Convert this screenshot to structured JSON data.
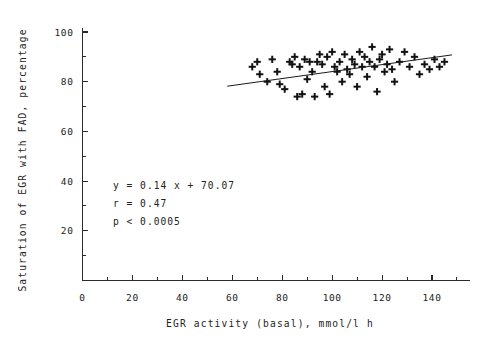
{
  "chart_data": {
    "type": "scatter",
    "title": "",
    "xlabel": "EGR activity (basal), mmol/l h",
    "ylabel": "Saturation of EGR with FAD, percentage",
    "xlim": [
      0,
      160
    ],
    "ylim": [
      0,
      110
    ],
    "x_ticks": [
      0,
      20,
      40,
      60,
      80,
      100,
      120,
      140
    ],
    "x_tick_labels": [
      "0",
      "20",
      "40",
      "60",
      "80",
      "100",
      "120",
      "140"
    ],
    "x_minor_step": 10,
    "y_ticks": [
      20,
      40,
      60,
      80,
      100
    ],
    "y_tick_labels": [
      "20",
      "40",
      "60",
      "80",
      "100"
    ],
    "y_minor_step": 10,
    "grid": false,
    "legend": false,
    "marker": "plus",
    "marker_color": "#121212",
    "line_color": "#1a1a1a",
    "annotations": {
      "equation": "y = 0.14 x + 70.07",
      "correlation": "r = 0.47",
      "pvalue": "p < 0.0005"
    },
    "fit": {
      "slope": 0.14,
      "intercept": 70.07,
      "r": 0.47,
      "p_text": "p < 0.0005",
      "x_start": 58,
      "x_end": 148
    },
    "points": [
      [
        68,
        86
      ],
      [
        70,
        88
      ],
      [
        71,
        83
      ],
      [
        74,
        80
      ],
      [
        76,
        89
      ],
      [
        78,
        84
      ],
      [
        79,
        79
      ],
      [
        81,
        77
      ],
      [
        83,
        88
      ],
      [
        84,
        87
      ],
      [
        85,
        90
      ],
      [
        86,
        74
      ],
      [
        87,
        86
      ],
      [
        88,
        75
      ],
      [
        89,
        89
      ],
      [
        90,
        81
      ],
      [
        91,
        88
      ],
      [
        92,
        84
      ],
      [
        93,
        74
      ],
      [
        94,
        88
      ],
      [
        95,
        91
      ],
      [
        96,
        87
      ],
      [
        97,
        78
      ],
      [
        98,
        90
      ],
      [
        99,
        75
      ],
      [
        100,
        92
      ],
      [
        101,
        86
      ],
      [
        102,
        84
      ],
      [
        103,
        88
      ],
      [
        104,
        80
      ],
      [
        105,
        91
      ],
      [
        106,
        85
      ],
      [
        107,
        83
      ],
      [
        108,
        89
      ],
      [
        109,
        87
      ],
      [
        110,
        78
      ],
      [
        111,
        92
      ],
      [
        112,
        86
      ],
      [
        113,
        90
      ],
      [
        114,
        82
      ],
      [
        115,
        88
      ],
      [
        116,
        94
      ],
      [
        117,
        86
      ],
      [
        118,
        76
      ],
      [
        119,
        89
      ],
      [
        120,
        91
      ],
      [
        121,
        84
      ],
      [
        122,
        87
      ],
      [
        123,
        93
      ],
      [
        124,
        85
      ],
      [
        125,
        80
      ],
      [
        127,
        88
      ],
      [
        129,
        92
      ],
      [
        131,
        86
      ],
      [
        133,
        90
      ],
      [
        135,
        83
      ],
      [
        137,
        87
      ],
      [
        139,
        85
      ],
      [
        141,
        89
      ],
      [
        143,
        86
      ],
      [
        145,
        88
      ]
    ]
  }
}
